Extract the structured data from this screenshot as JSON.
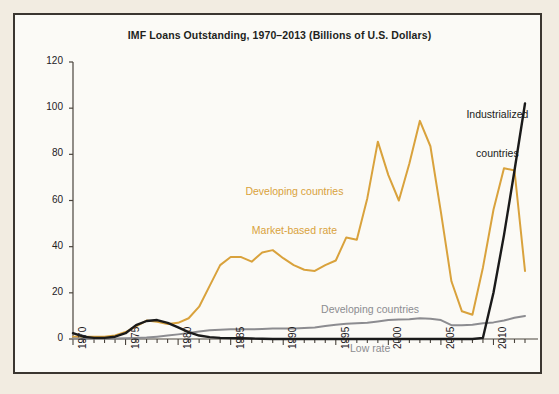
{
  "figure": {
    "background_color": "#f2ece1",
    "panel_color": "#fbfaf6",
    "border_color": "#3b3630",
    "title": "IMF Loans Outstanding, 1970–2013 (Billions of U.S. Dollars)"
  },
  "annotations": {
    "industrialized": {
      "line1": "Industrialized",
      "line2": "countries",
      "color": "#1a1a1a"
    },
    "developing_market": {
      "line1": "Developing countries",
      "line2": "Market-based rate",
      "color": "#d9a23c"
    },
    "developing_low": {
      "line1": "Developing countries",
      "line2": "Low rate",
      "color": "#8c8c90"
    }
  },
  "chart_data": {
    "type": "line",
    "title": "IMF Loans Outstanding, 1970–2013 (Billions of U.S. Dollars)",
    "xlabel": "",
    "ylabel": "",
    "xlim": [
      1970,
      2013
    ],
    "ylim": [
      0,
      120
    ],
    "yticks": [
      0,
      20,
      40,
      60,
      80,
      100,
      120
    ],
    "xticks": [
      1970,
      1975,
      1980,
      1985,
      1990,
      1995,
      2000,
      2005,
      2010
    ],
    "x_minor_tick_step": 1,
    "grid": false,
    "legend": "inline-annotations",
    "x": [
      1970,
      1971,
      1972,
      1973,
      1974,
      1975,
      1976,
      1977,
      1978,
      1979,
      1980,
      1981,
      1982,
      1983,
      1984,
      1985,
      1986,
      1987,
      1988,
      1989,
      1990,
      1991,
      1992,
      1993,
      1994,
      1995,
      1996,
      1997,
      1998,
      1999,
      2000,
      2001,
      2002,
      2003,
      2004,
      2005,
      2006,
      2007,
      2008,
      2009,
      2010,
      2011,
      2012,
      2013
    ],
    "series": [
      {
        "name": "Developing countries Market-based rate",
        "color": "#d9a23c",
        "values": [
          1.0,
          1.0,
          1.0,
          1.0,
          1.5,
          3.0,
          5.5,
          8.0,
          7.5,
          6.5,
          7.0,
          9.0,
          14.0,
          23.0,
          32.0,
          35.5,
          35.5,
          33.5,
          37.5,
          38.5,
          35.0,
          32.0,
          30.0,
          29.5,
          32.0,
          34.0,
          44.0,
          43.0,
          61.0,
          85.5,
          71.0,
          60.0,
          76.0,
          94.5,
          83.5,
          55.0,
          25.0,
          12.0,
          10.5,
          31.0,
          56.0,
          74.0,
          73.0,
          29.5
        ],
        "style": "solid"
      },
      {
        "name": "Developing countries Low rate",
        "color": "#8c8c90",
        "values": [
          0.2,
          0.2,
          0.2,
          0.2,
          0.2,
          0.3,
          0.4,
          0.6,
          1.0,
          1.5,
          2.0,
          2.6,
          3.2,
          3.8,
          4.0,
          4.2,
          4.2,
          4.2,
          4.3,
          4.5,
          4.5,
          4.6,
          4.8,
          5.0,
          5.6,
          6.2,
          6.6,
          6.8,
          7.0,
          7.6,
          8.2,
          8.4,
          8.6,
          9.0,
          8.8,
          8.2,
          6.0,
          6.0,
          6.2,
          6.8,
          7.2,
          8.0,
          9.2,
          10.0
        ],
        "style": "solid"
      },
      {
        "name": "Industrialized countries",
        "color": "#1a1a1a",
        "values": [
          2.5,
          1.0,
          0.5,
          0.5,
          1.0,
          2.5,
          6.0,
          7.8,
          8.2,
          7.0,
          5.0,
          3.0,
          1.5,
          0.8,
          0.5,
          0.4,
          0.3,
          0.2,
          0.1,
          0.0,
          0.0,
          0.0,
          0.0,
          0.0,
          0.0,
          0.0,
          0.0,
          0.0,
          0.0,
          0.0,
          0.0,
          0.0,
          0.0,
          0.0,
          0.0,
          0.0,
          0.0,
          0.0,
          0.0,
          0.5,
          20.0,
          45.0,
          73.0,
          102.0
        ],
        "style": "solid"
      }
    ]
  }
}
